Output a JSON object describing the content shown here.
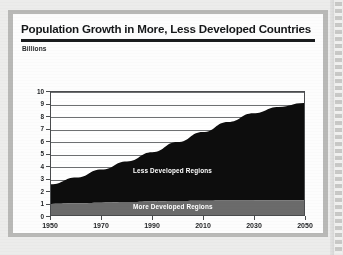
{
  "header": {
    "title": "Population Growth in More, Less Developed Countries",
    "subtitle": "Billions"
  },
  "colors": {
    "less_developed": "#0d0d0d",
    "more_developed": "#6b6b6b",
    "axis": "#4a4c4e",
    "card": "#fdfdfd",
    "frame": "#b9b9b7",
    "label_text": "#ffffff"
  },
  "chart_data": {
    "type": "area",
    "stacked": true,
    "title": "Population Growth in More, Less Developed Countries",
    "xlabel": "",
    "ylabel": "Billions",
    "xlim": [
      1950,
      2050
    ],
    "ylim": [
      0,
      10
    ],
    "grid": true,
    "legend": "in-plot labels",
    "x": [
      1950,
      1960,
      1970,
      1980,
      1990,
      2000,
      2010,
      2020,
      2030,
      2040,
      2050
    ],
    "xticks": [
      "1950",
      "1970",
      "1990",
      "2010",
      "2030",
      "2050"
    ],
    "yticks": [
      "0",
      "1",
      "2",
      "3",
      "4",
      "5",
      "6",
      "7",
      "8",
      "9",
      "10"
    ],
    "series": [
      {
        "name": "More Developed Regions",
        "values": [
          0.9,
          0.95,
          1.0,
          1.05,
          1.1,
          1.13,
          1.15,
          1.17,
          1.18,
          1.19,
          1.2
        ]
      },
      {
        "name": "Less Developed Regions",
        "values": [
          1.6,
          2.1,
          2.7,
          3.3,
          4.0,
          4.8,
          5.6,
          6.4,
          7.1,
          7.6,
          7.9
        ]
      }
    ],
    "totals": [
      2.5,
      3.05,
      3.7,
      4.35,
      5.1,
      5.93,
      6.75,
      7.57,
      8.28,
      8.79,
      9.1
    ]
  },
  "axis": {
    "y_ticks": [
      "10",
      "9",
      "8",
      "7",
      "6",
      "5",
      "4",
      "3",
      "2",
      "1",
      "0"
    ],
    "x_ticks": [
      "1950",
      "1970",
      "1990",
      "2010",
      "2030",
      "2050"
    ]
  },
  "labels": {
    "less": "Less Developed Regions",
    "more": "More Developed Regions"
  }
}
